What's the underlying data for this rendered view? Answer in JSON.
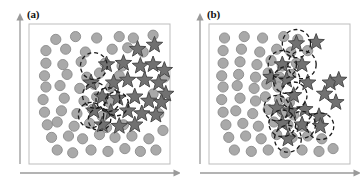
{
  "figure": {
    "caption_present": false,
    "background_color": "#ffffff",
    "panel_count": 2
  },
  "style": {
    "circle_fill": "#a9a9a9",
    "circle_stroke": "#8a8a8a",
    "star_fill": "#717171",
    "star_stroke": "#4a4a4a",
    "dashed_circle_stroke": "#1a1a1a",
    "axis_color": "#9a9a9a",
    "frame_color": "#bdbdbd",
    "circle_radius": 5.1,
    "star_radius": 8.6,
    "dash_pattern": "4,3",
    "dash_width": 1.3
  },
  "chart_data": [
    {
      "type": "scatter",
      "panel": "a",
      "title": "(a)",
      "xlabel": "",
      "ylabel": "",
      "xlim": [
        0,
        100
      ],
      "ylim": [
        0,
        100
      ],
      "grid": false,
      "legend": "none",
      "axis_style": "arrow",
      "description": "Two-class scatter: light gray circles spread broadly across the region, dark gray stars concentrated in the upper-right; dashed circles mark isolated/boundary stars embedded in the circle population.",
      "series": [
        {
          "name": "circles",
          "marker": "circle",
          "color": "#a9a9a9",
          "count": 61,
          "points": [
            [
              19,
              89
            ],
            [
              33,
              91
            ],
            [
              48,
              90
            ],
            [
              64,
              91
            ],
            [
              74,
              90
            ],
            [
              88,
              92
            ],
            [
              12,
              81
            ],
            [
              26,
              82
            ],
            [
              40,
              80
            ],
            [
              59,
              82
            ],
            [
              70,
              83
            ],
            [
              81,
              80
            ],
            [
              12,
              72
            ],
            [
              24,
              71
            ],
            [
              37,
              73
            ],
            [
              54,
              72
            ],
            [
              66,
              70
            ],
            [
              11,
              63
            ],
            [
              27,
              64
            ],
            [
              41,
              62
            ],
            [
              50,
              65
            ],
            [
              64,
              63
            ],
            [
              12,
              55
            ],
            [
              22,
              56
            ],
            [
              36,
              54
            ],
            [
              46,
              57
            ],
            [
              58,
              55
            ],
            [
              10,
              46
            ],
            [
              25,
              47
            ],
            [
              39,
              45
            ],
            [
              48,
              48
            ],
            [
              57,
              44
            ],
            [
              11,
              37
            ],
            [
              23,
              38
            ],
            [
              34,
              36
            ],
            [
              45,
              39
            ],
            [
              52,
              34
            ],
            [
              13,
              28
            ],
            [
              20,
              30
            ],
            [
              32,
              27
            ],
            [
              43,
              29
            ],
            [
              55,
              26
            ],
            [
              67,
              28
            ],
            [
              16,
              19
            ],
            [
              28,
              20
            ],
            [
              38,
              18
            ],
            [
              50,
              21
            ],
            [
              61,
              19
            ],
            [
              73,
              20
            ],
            [
              85,
              18
            ],
            [
              20,
              10
            ],
            [
              31,
              8
            ],
            [
              44,
              10
            ],
            [
              56,
              9
            ],
            [
              68,
              11
            ],
            [
              79,
              9
            ],
            [
              90,
              10
            ],
            [
              95,
              24
            ],
            [
              92,
              36
            ],
            [
              88,
              50
            ],
            [
              96,
              62
            ]
          ]
        },
        {
          "name": "stars",
          "marker": "star",
          "color": "#717171",
          "count": 26,
          "points": [
            [
              77,
              82
            ],
            [
              89,
              85
            ],
            [
              55,
              71
            ],
            [
              67,
              72
            ],
            [
              79,
              70
            ],
            [
              88,
              71
            ],
            [
              96,
              67
            ],
            [
              70,
              60
            ],
            [
              82,
              60
            ],
            [
              92,
              58
            ],
            [
              97,
              50
            ],
            [
              52,
              48
            ],
            [
              63,
              47
            ],
            [
              75,
              48
            ],
            [
              85,
              45
            ],
            [
              94,
              44
            ],
            [
              46,
              38
            ],
            [
              58,
              37
            ],
            [
              70,
              38
            ],
            [
              80,
              36
            ],
            [
              90,
              35
            ],
            [
              52,
              28
            ],
            [
              64,
              27
            ],
            [
              75,
              28
            ],
            [
              44,
              58
            ],
            [
              60,
              58
            ]
          ]
        }
      ],
      "annotations": {
        "type": "dashed-circle",
        "meaning": "boundary or isolated star regions",
        "count": 6,
        "circles": [
          {
            "cx": 46,
            "cy": 70,
            "r": 9.5
          },
          {
            "cx": 47,
            "cy": 49,
            "r": 9.0
          },
          {
            "cx": 56,
            "cy": 46,
            "r": 8.5
          },
          {
            "cx": 62,
            "cy": 43,
            "r": 8.5
          },
          {
            "cx": 44,
            "cy": 35,
            "r": 9.0
          },
          {
            "cx": 50,
            "cy": 32,
            "r": 8.0
          }
        ]
      }
    },
    {
      "type": "scatter",
      "panel": "b",
      "title": "(b)",
      "xlabel": "",
      "ylabel": "",
      "xlim": [
        0,
        100
      ],
      "ylim": [
        0,
        100
      ],
      "grid": false,
      "legend": "none",
      "axis_style": "arrow",
      "description": "Two-class scatter with a cleaner separation: circles occupy the lower-left, stars the upper-right, separated by a diagonal boundary; a chain of dashed circles runs along the diagonal boundary marking the overlapping margin samples.",
      "series": [
        {
          "name": "circles",
          "marker": "circle",
          "color": "#a9a9a9",
          "count": 60,
          "points": [
            [
              11,
              90
            ],
            [
              25,
              91
            ],
            [
              38,
              90
            ],
            [
              53,
              91
            ],
            [
              63,
              89
            ],
            [
              10,
              81
            ],
            [
              23,
              82
            ],
            [
              36,
              80
            ],
            [
              48,
              82
            ],
            [
              58,
              80
            ],
            [
              70,
              81
            ],
            [
              10,
              72
            ],
            [
              22,
              73
            ],
            [
              34,
              71
            ],
            [
              44,
              74
            ],
            [
              52,
              70
            ],
            [
              62,
              72
            ],
            [
              9,
              63
            ],
            [
              21,
              64
            ],
            [
              33,
              62
            ],
            [
              42,
              65
            ],
            [
              50,
              62
            ],
            [
              58,
              64
            ],
            [
              10,
              55
            ],
            [
              20,
              56
            ],
            [
              32,
              54
            ],
            [
              41,
              57
            ],
            [
              49,
              55
            ],
            [
              9,
              46
            ],
            [
              22,
              47
            ],
            [
              33,
              45
            ],
            [
              40,
              48
            ],
            [
              50,
              46
            ],
            [
              57,
              44
            ],
            [
              10,
              37
            ],
            [
              19,
              38
            ],
            [
              31,
              36
            ],
            [
              42,
              39
            ],
            [
              52,
              37
            ],
            [
              60,
              35
            ],
            [
              12,
              28
            ],
            [
              24,
              29
            ],
            [
              35,
              27
            ],
            [
              46,
              30
            ],
            [
              56,
              28
            ],
            [
              66,
              27
            ],
            [
              14,
              19
            ],
            [
              26,
              20
            ],
            [
              37,
              18
            ],
            [
              48,
              21
            ],
            [
              59,
              19
            ],
            [
              70,
              20
            ],
            [
              80,
              18
            ],
            [
              18,
              10
            ],
            [
              30,
              9
            ],
            [
              42,
              10
            ],
            [
              54,
              8
            ],
            [
              66,
              10
            ],
            [
              78,
              9
            ],
            [
              88,
              11
            ]
          ]
        },
        {
          "name": "stars",
          "marker": "star",
          "color": "#717171",
          "count": 20,
          "points": [
            [
              62,
              86
            ],
            [
              76,
              87
            ],
            [
              52,
              71
            ],
            [
              66,
              71
            ],
            [
              55,
              60
            ],
            [
              70,
              58
            ],
            [
              86,
              58
            ],
            [
              60,
              49
            ],
            [
              82,
              50
            ],
            [
              68,
              39
            ],
            [
              78,
              34
            ],
            [
              52,
              29
            ],
            [
              66,
              28
            ],
            [
              79,
              27
            ],
            [
              56,
              18
            ],
            [
              90,
              44
            ],
            [
              92,
              60
            ],
            [
              44,
              62
            ],
            [
              48,
              40
            ],
            [
              58,
              38
            ]
          ]
        }
      ],
      "annotations": {
        "type": "dashed-circle",
        "meaning": "overlapping boundary samples along the class margin",
        "count": 10,
        "circles": [
          {
            "cx": 62,
            "cy": 86,
            "r": 10.0
          },
          {
            "cx": 52,
            "cy": 71,
            "r": 10.0
          },
          {
            "cx": 66,
            "cy": 71,
            "r": 10.0
          },
          {
            "cx": 55,
            "cy": 60,
            "r": 9.5
          },
          {
            "cx": 60,
            "cy": 49,
            "r": 9.5
          },
          {
            "cx": 52,
            "cy": 29,
            "r": 9.5
          },
          {
            "cx": 66,
            "cy": 28,
            "r": 9.5
          },
          {
            "cx": 79,
            "cy": 27,
            "r": 9.5
          },
          {
            "cx": 56,
            "cy": 18,
            "r": 9.5
          },
          {
            "cx": 48,
            "cy": 40,
            "r": 9.0
          }
        ]
      }
    }
  ]
}
